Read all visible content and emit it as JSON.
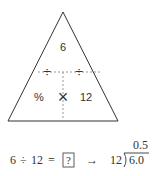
{
  "triangle": {
    "top_value": "6",
    "left_divide": "÷",
    "right_divide": "÷",
    "bottom_left": "%",
    "multiply": "×",
    "bottom_right": "12"
  },
  "equation": {
    "dividend": "6",
    "operator": "÷",
    "divisor": "12",
    "equals": "=",
    "unknown": "?",
    "arrow": "→",
    "long_divisor": "12",
    "long_dividend": "6.0",
    "quotient": "0.5"
  },
  "colors": {
    "line": "#333333",
    "dashed": "#9a9a9a"
  }
}
